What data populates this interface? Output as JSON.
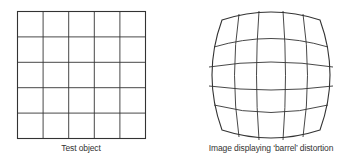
{
  "figures": [
    {
      "id": "test-object",
      "caption": "Test object",
      "grid": {
        "rows": 5,
        "cols": 5
      }
    },
    {
      "id": "barrel-distortion",
      "caption": "Image displaying ‘barrel’ distortion",
      "grid": {
        "rows": 5,
        "cols": 5
      }
    }
  ],
  "colors": {
    "line": "#333333",
    "background": "#ffffff"
  }
}
